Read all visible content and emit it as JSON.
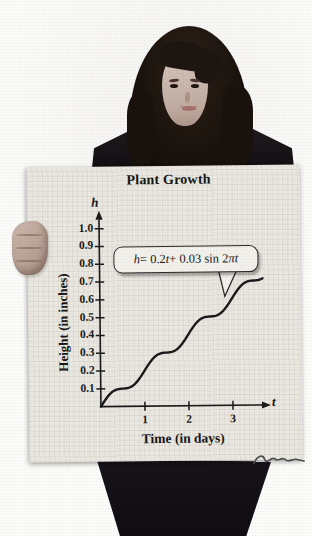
{
  "figure": {
    "poster": {
      "title": "Plant Growth",
      "annotation": {
        "full": "h = 0.2t + 0.03 sin 2πt",
        "parts": {
          "h": "h",
          "eq": " = 0.2",
          "t1": "t",
          "mid": " + 0.03 sin 2",
          "pi": "π",
          "t2": "t"
        }
      },
      "y_axis": {
        "symbol": "h",
        "label": "Height (in inches)"
      },
      "x_axis": {
        "symbol": "t",
        "label": "Time (in days)"
      }
    }
  },
  "chart_data": {
    "type": "line",
    "title": "Plant Growth",
    "xlabel": "Time (in days)",
    "ylabel": "Height (in inches)",
    "x_symbol": "t",
    "y_symbol": "h",
    "xlim": [
      0,
      3.8
    ],
    "ylim": [
      0,
      1.08
    ],
    "xticks": [
      1,
      2,
      3
    ],
    "yticks": [
      0.1,
      0.2,
      0.3,
      0.4,
      0.5,
      0.6,
      0.7,
      0.8,
      0.9,
      1.0
    ],
    "grid": false,
    "legend": null,
    "annotation": "h = 0.2t + 0.03 sin 2πt",
    "curve": {
      "formula": "h = 0.2t + 0.03 sin(2πt)",
      "slope": 0.2,
      "amplitude": 0.03,
      "period": 1,
      "t_start": 0,
      "t_end": 3.7
    },
    "series": [
      {
        "name": "h(t)",
        "x": [
          0,
          0.25,
          0.5,
          0.75,
          1,
          1.25,
          1.5,
          1.75,
          2,
          2.25,
          2.5,
          2.75,
          3,
          3.25,
          3.5,
          3.7
        ],
        "y": [
          0,
          0.08,
          0.1,
          0.12,
          0.2,
          0.28,
          0.3,
          0.32,
          0.4,
          0.48,
          0.5,
          0.52,
          0.6,
          0.68,
          0.7,
          0.71
        ]
      }
    ],
    "colors": {
      "line": "#1b1b1b",
      "ink": "#1a1a1a",
      "poster": "#ebe8e2"
    }
  }
}
